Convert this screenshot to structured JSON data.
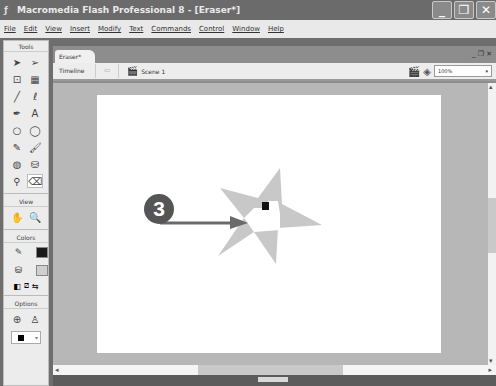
{
  "window": {
    "title": "Macromedia Flash Professional 8 - [Eraser*]",
    "controls": {
      "minimize": "_",
      "restore": "❐",
      "close": "✕"
    }
  },
  "menubar": {
    "items": [
      "File",
      "Edit",
      "View",
      "Insert",
      "Modify",
      "Text",
      "Commands",
      "Control",
      "Window",
      "Help"
    ]
  },
  "tools_panel": {
    "tools_header": "Tools",
    "tools": [
      {
        "name": "selection-tool",
        "glyph": "➤"
      },
      {
        "name": "subselection-tool",
        "glyph": "➢"
      },
      {
        "name": "free-transform-tool",
        "glyph": "⊡"
      },
      {
        "name": "fill-transform-tool",
        "glyph": "▦"
      },
      {
        "name": "line-tool",
        "glyph": "╱"
      },
      {
        "name": "lasso-tool",
        "glyph": "ℓ"
      },
      {
        "name": "pen-tool",
        "glyph": "✒"
      },
      {
        "name": "text-tool",
        "glyph": "A"
      },
      {
        "name": "oval-tool",
        "glyph": "○"
      },
      {
        "name": "rectangle-tool",
        "glyph": "◯"
      },
      {
        "name": "pencil-tool",
        "glyph": "✎"
      },
      {
        "name": "brush-tool",
        "glyph": "🖌"
      },
      {
        "name": "ink-bottle-tool",
        "glyph": "◍"
      },
      {
        "name": "paint-bucket-tool",
        "glyph": "⛁"
      },
      {
        "name": "eyedropper-tool",
        "glyph": "⚲"
      },
      {
        "name": "eraser-tool",
        "glyph": "⌫"
      }
    ],
    "view_header": "View",
    "view_tools": [
      {
        "name": "hand-tool",
        "glyph": "✋"
      },
      {
        "name": "zoom-tool",
        "glyph": "🔍"
      }
    ],
    "colors_header": "Colors",
    "stroke_color": "#1a1a1a",
    "fill_color": "#cfcfcf",
    "options_header": "Options",
    "eraser_shape_color": "#000000"
  },
  "document": {
    "tab_label": "Eraser*",
    "timeline_label": "Timeline",
    "scene_label": "Scene 1",
    "zoom_value": "100%",
    "doc_controls": "_ ❐ ✕"
  },
  "annotation": {
    "callout_number": "3"
  },
  "colors": {
    "star_fill": "#c8c8c8",
    "callout_bg": "#555555",
    "arrow": "#6a6a6a",
    "stage": "#ffffff",
    "pasteboard": "#b7b7b7"
  }
}
